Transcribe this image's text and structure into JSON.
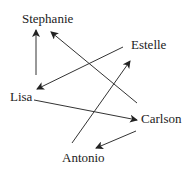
{
  "diagram": {
    "type": "directed-graph",
    "nodes": [
      {
        "id": "stephanie",
        "label": "Stephanie"
      },
      {
        "id": "estelle",
        "label": "Estelle"
      },
      {
        "id": "lisa",
        "label": "Lisa"
      },
      {
        "id": "carlson",
        "label": "Carlson"
      },
      {
        "id": "antonio",
        "label": "Antonio"
      }
    ],
    "edges": [
      {
        "from": "Lisa",
        "to": "Stephanie"
      },
      {
        "from": "Estelle",
        "to": "Lisa"
      },
      {
        "from": "Carlson",
        "to": "Stephanie"
      },
      {
        "from": "Antonio",
        "to": "Estelle"
      },
      {
        "from": "Lisa",
        "to": "Carlson"
      },
      {
        "from": "Carlson",
        "to": "Antonio"
      }
    ]
  }
}
